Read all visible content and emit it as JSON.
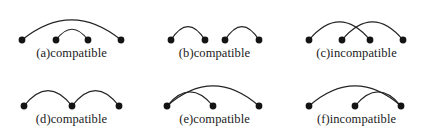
{
  "figure": {
    "title": "",
    "background_color": "#ffffff",
    "stroke_color": "#232323",
    "node_color": "#141414",
    "columns": 3,
    "rows": 2
  },
  "panels": [
    {
      "id": "a",
      "caption": "(a)compatible",
      "verdict": "compatible",
      "node_count": 4,
      "nodes": [
        {
          "index": 1,
          "x": 22,
          "y": 40
        },
        {
          "index": 2,
          "x": 56,
          "y": 40
        },
        {
          "index": 3,
          "x": 88,
          "y": 40
        },
        {
          "index": 4,
          "x": 121,
          "y": 40
        }
      ],
      "arcs": [
        {
          "from": 1,
          "to": 4,
          "height": 30,
          "relation": "outer"
        },
        {
          "from": 2,
          "to": 3,
          "height": 16,
          "relation": "inner"
        }
      ],
      "arc_relation": "nested"
    },
    {
      "id": "b",
      "caption": "(b)compatible",
      "verdict": "compatible",
      "node_count": 4,
      "nodes": [
        {
          "index": 1,
          "x": 28,
          "y": 40
        },
        {
          "index": 2,
          "x": 62,
          "y": 40
        },
        {
          "index": 3,
          "x": 82,
          "y": 40
        },
        {
          "index": 4,
          "x": 116,
          "y": 40
        }
      ],
      "arcs": [
        {
          "from": 1,
          "to": 2,
          "height": 20,
          "relation": "left"
        },
        {
          "from": 3,
          "to": 4,
          "height": 20,
          "relation": "right"
        }
      ],
      "arc_relation": "disjoint"
    },
    {
      "id": "c",
      "caption": "(c)incompatible",
      "verdict": "incompatible",
      "node_count": 4,
      "nodes": [
        {
          "index": 1,
          "x": 24,
          "y": 40
        },
        {
          "index": 2,
          "x": 57,
          "y": 40
        },
        {
          "index": 3,
          "x": 85,
          "y": 40
        },
        {
          "index": 4,
          "x": 118,
          "y": 40
        }
      ],
      "arcs": [
        {
          "from": 1,
          "to": 3,
          "height": 27,
          "relation": "crossing-first"
        },
        {
          "from": 2,
          "to": 4,
          "height": 27,
          "relation": "crossing-second"
        }
      ],
      "arc_relation": "crossing"
    },
    {
      "id": "d",
      "caption": "(d)compatible",
      "verdict": "compatible",
      "node_count": 3,
      "nodes": [
        {
          "index": 1,
          "x": 24,
          "y": 40
        },
        {
          "index": 2,
          "x": 72,
          "y": 40
        },
        {
          "index": 3,
          "x": 119,
          "y": 40
        }
      ],
      "arcs": [
        {
          "from": 1,
          "to": 2,
          "height": 23,
          "relation": "left"
        },
        {
          "from": 2,
          "to": 3,
          "height": 23,
          "relation": "right"
        }
      ],
      "arc_relation": "adjacent-shared-middle"
    },
    {
      "id": "e",
      "caption": "(e)compatible",
      "verdict": "compatible",
      "node_count": 3,
      "nodes": [
        {
          "index": 1,
          "x": 24,
          "y": 40
        },
        {
          "index": 2,
          "x": 70,
          "y": 40
        },
        {
          "index": 3,
          "x": 116,
          "y": 40
        }
      ],
      "arcs": [
        {
          "from": 1,
          "to": 3,
          "height": 30,
          "relation": "outer"
        },
        {
          "from": 1,
          "to": 2,
          "height": 21,
          "relation": "inner"
        }
      ],
      "arc_relation": "shared-left-endpoint"
    },
    {
      "id": "f",
      "caption": "(f)incompatible",
      "verdict": "incompatible",
      "node_count": 3,
      "nodes": [
        {
          "index": 1,
          "x": 24,
          "y": 40
        },
        {
          "index": 2,
          "x": 70,
          "y": 40
        },
        {
          "index": 3,
          "x": 116,
          "y": 40
        }
      ],
      "arcs": [
        {
          "from": 1,
          "to": 3,
          "height": 30,
          "relation": "outer"
        },
        {
          "from": 2,
          "to": 3,
          "height": 21,
          "relation": "inner"
        }
      ],
      "arc_relation": "shared-right-endpoint"
    }
  ]
}
